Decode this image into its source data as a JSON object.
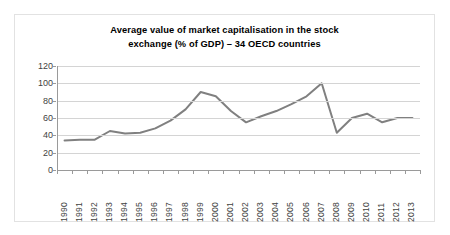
{
  "chart_data": {
    "type": "line",
    "title": "Average value of market capitalisation in the stock exchange (% of GDP) – 34 OECD countries",
    "title_lines": [
      "Average value of market capitalisation in the stock",
      "exchange (% of GDP) – 34 OECD countries"
    ],
    "xlabel": "",
    "ylabel": "",
    "ylim": [
      0,
      120
    ],
    "ytick_values": [
      0,
      20,
      40,
      60,
      80,
      100,
      120
    ],
    "ytick_labels": [
      "0",
      "20",
      "40",
      "60",
      "80",
      "100",
      "120"
    ],
    "grid": true,
    "legend": "none",
    "line_color": "#808080",
    "line_width": 2,
    "categories": [
      "1990",
      "1991",
      "1992",
      "1993",
      "1994",
      "1995",
      "1996",
      "1997",
      "1998",
      "1999",
      "2000",
      "2001",
      "2002",
      "2003",
      "2004",
      "2005",
      "2006",
      "2007",
      "2008",
      "2009",
      "2010",
      "2011",
      "2012",
      "2013"
    ],
    "series": [
      {
        "name": "Average market capitalisation (% of GDP)",
        "values": [
          34,
          35,
          35,
          45,
          42,
          43,
          48,
          57,
          70,
          90,
          85,
          68,
          55,
          62,
          68,
          76,
          85,
          100,
          43,
          60,
          65,
          55,
          60,
          60
        ]
      }
    ]
  }
}
